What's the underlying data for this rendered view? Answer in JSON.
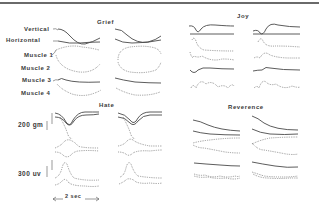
{
  "figure": {
    "row_labels": [
      "Vertical",
      "Horizontal",
      "Muscle 1",
      "Muscle 2",
      "Muscle 3",
      "Muscle 4"
    ],
    "panels": [
      {
        "title": "Grief"
      },
      {
        "title": "Joy"
      },
      {
        "title": "Hate"
      },
      {
        "title": "Reverence"
      }
    ],
    "scale_bars": {
      "force": "200 gm",
      "emg": "300 uv",
      "time": "2 sec"
    },
    "colors": {
      "background": "#ffffff",
      "ink": "#4a4a4a",
      "border": "#6a6a6a"
    }
  }
}
